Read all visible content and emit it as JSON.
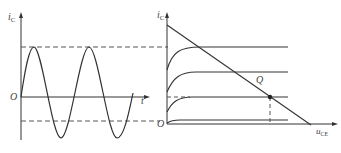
{
  "left_plot": {
    "y_axis_label": "i",
    "y_axis_sub": "C",
    "x_axis_label": "t",
    "origin_label": "O",
    "waveform": "sinusoid",
    "upper_limit": "dashed line at peak",
    "lower_limit": "dashed line at cutoff level"
  },
  "right_plot": {
    "y_axis_label": "i",
    "y_axis_sub": "C",
    "x_axis_label": "u",
    "x_axis_sub": "CE",
    "origin_label": "O",
    "point_label": "Q",
    "curves": "transistor output characteristic curves (4)",
    "load_line": "DC load line"
  },
  "colors": {
    "line": "#333333",
    "dashed": "#555555",
    "background": "#ffffff"
  }
}
